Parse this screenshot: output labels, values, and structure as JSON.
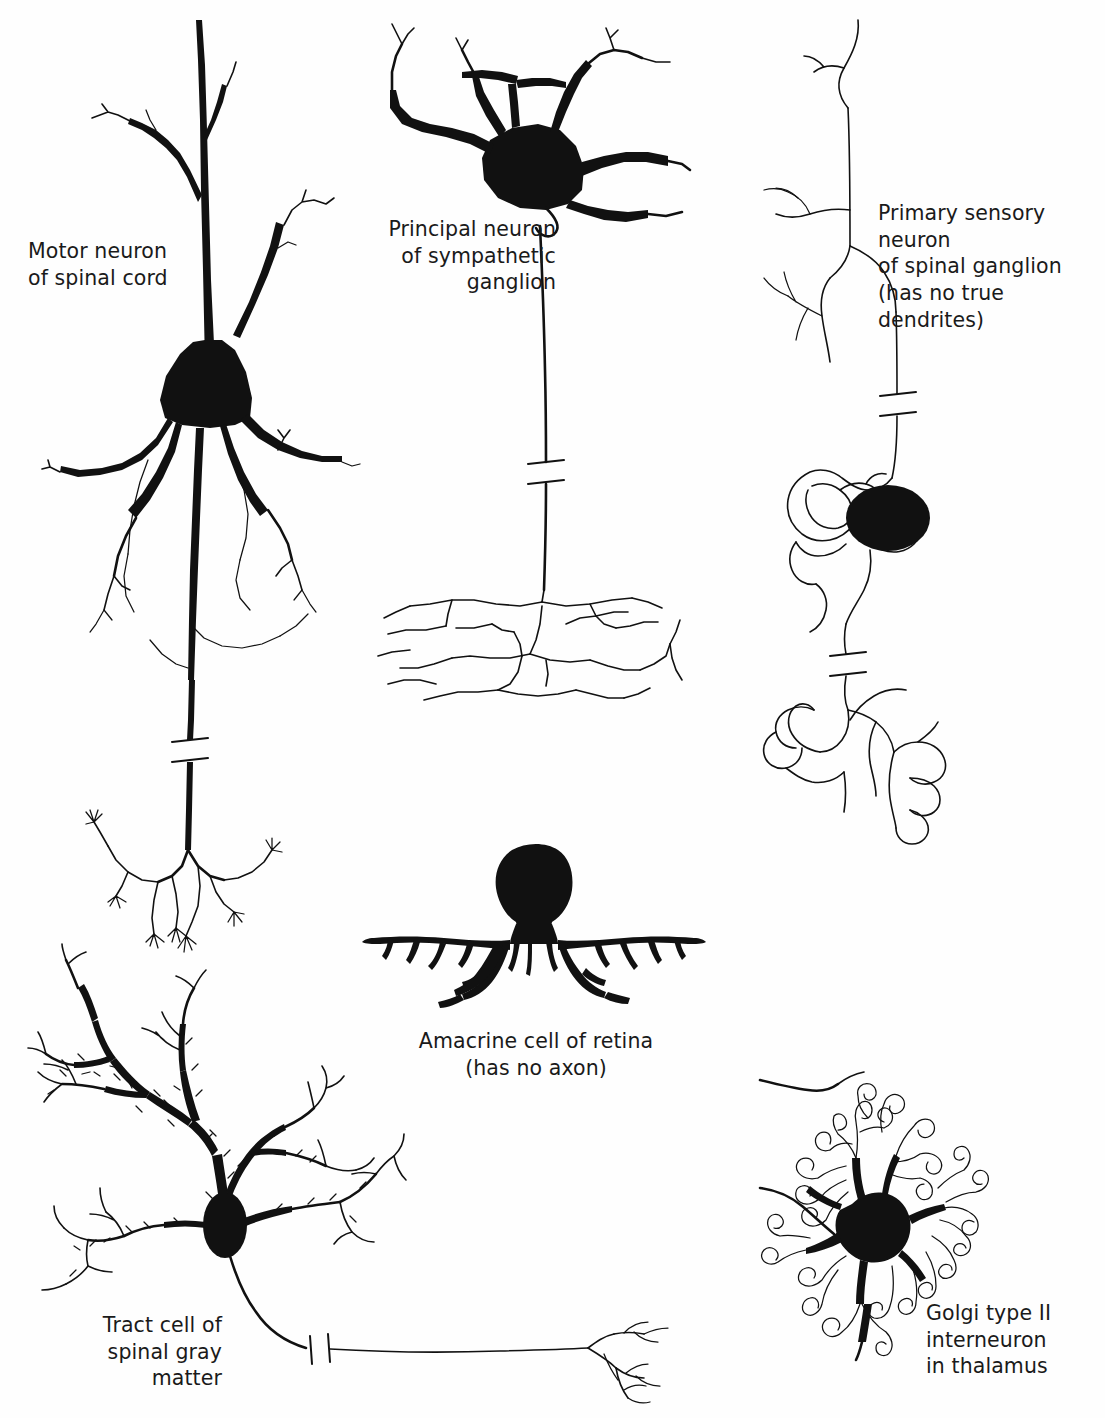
{
  "plate": {
    "title": "Types of neurons",
    "background_color": "#fefefe",
    "ink_color": "#111111",
    "width": 1105,
    "height": 1418
  },
  "figures": [
    {
      "id": "motor-neuron",
      "label": "Motor neuron\nof spinal cord",
      "label_align": "left",
      "label_x": 28,
      "label_y": 238,
      "soma_shape": "triangular",
      "soma_fill": "solid-black",
      "features": [
        "apical dendrite",
        "basal dendrite tree",
        "axon with break mark",
        "motor end-plate terminal branches"
      ]
    },
    {
      "id": "sympathetic-principal-neuron",
      "label": "Principal neuron\nof sympathetic\nganglion",
      "label_align": "right",
      "label_x": 388,
      "label_y": 216,
      "soma_shape": "multipolar",
      "soma_fill": "solid-black",
      "features": [
        "thick radiating dendrites",
        "long axon with break mark",
        "terminal plexus mesh"
      ]
    },
    {
      "id": "primary-sensory-neuron",
      "label": "Primary sensory neuron\nof spinal ganglion\n(has no true dendrites)",
      "label_align": "left",
      "label_x": 878,
      "label_y": 200,
      "soma_shape": "round",
      "soma_fill": "solid-black",
      "features": [
        "pseudounipolar",
        "peripheral process",
        "central process",
        "satellite cell outline",
        "two break marks",
        "coiled terminal loops"
      ]
    },
    {
      "id": "amacrine-cell",
      "label": "Amacrine cell of retina\n(has no axon)",
      "label_align": "center",
      "label_x": 416,
      "label_y": 1028,
      "soma_shape": "bulbous",
      "soma_fill": "solid-black",
      "features": [
        "no axon",
        "wide horizontal dendritic spread"
      ]
    },
    {
      "id": "tract-cell",
      "label": "Tract cell of\nspinal gray\nmatter",
      "label_align": "right",
      "label_x": 92,
      "label_y": 1312,
      "soma_shape": "oval",
      "soma_fill": "solid-black",
      "features": [
        "spiny dendritic tree",
        "long axon with break mark",
        "terminal branching"
      ]
    },
    {
      "id": "golgi-type-2-interneuron",
      "label": "Golgi type II\ninterneuron\nin thalamus",
      "label_align": "left",
      "label_x": 926,
      "label_y": 1300,
      "soma_shape": "stellate",
      "soma_fill": "solid-black",
      "features": [
        "dense curly appendages",
        "short local axon"
      ]
    }
  ]
}
